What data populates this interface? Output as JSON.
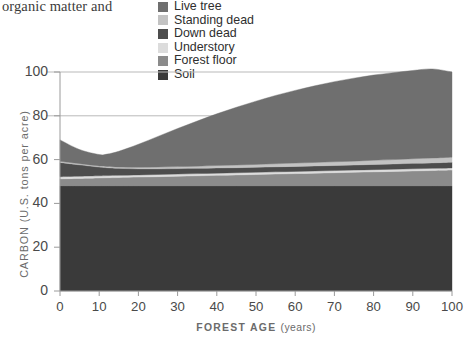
{
  "page": {
    "cut_off_text": "organic matter and"
  },
  "legend": {
    "position": "top-center",
    "items": [
      {
        "label": "Live tree",
        "color": "#6f6f6f",
        "key": "live_tree"
      },
      {
        "label": "Standing dead",
        "color": "#c3c3c3",
        "key": "standing_dead"
      },
      {
        "label": "Down dead",
        "color": "#4d4d4d",
        "key": "down_dead"
      },
      {
        "label": "Understory",
        "color": "#dcdcdc",
        "key": "understory"
      },
      {
        "label": "Forest floor",
        "color": "#8b8b8b",
        "key": "forest_floor"
      },
      {
        "label": "Soil",
        "color": "#3a3a3a",
        "key": "soil"
      }
    ]
  },
  "axes": {
    "x_label_main": "FOREST AGE",
    "x_label_unit": "(years)",
    "y_label": "CARBON (U.S. tons per acre)",
    "x_ticks": [
      "0",
      "10",
      "20",
      "30",
      "40",
      "50",
      "60",
      "70",
      "80",
      "90",
      "100"
    ],
    "y_ticks": [
      "0",
      "20",
      "40",
      "60",
      "80",
      "100"
    ]
  },
  "chart_data": {
    "type": "area",
    "stacked": true,
    "title": "",
    "xlabel": "FOREST AGE (years)",
    "ylabel": "CARBON (U.S. tons per acre)",
    "xlim": [
      0,
      100
    ],
    "ylim": [
      0,
      100
    ],
    "xticks": [
      0,
      10,
      20,
      30,
      40,
      50,
      60,
      70,
      80,
      90,
      100
    ],
    "yticks": [
      0,
      20,
      40,
      60,
      80,
      100
    ],
    "grid": "horizontal-light",
    "legend_position": "top-center",
    "x": [
      0,
      5,
      10,
      12,
      15,
      20,
      25,
      30,
      35,
      40,
      45,
      50,
      55,
      60,
      65,
      70,
      75,
      80,
      85,
      90,
      95,
      100
    ],
    "series": [
      {
        "name": "Soil",
        "color": "#3a3a3a",
        "values": [
          48,
          48,
          48,
          48,
          48,
          48,
          48,
          48,
          48,
          48,
          48,
          48,
          48,
          48,
          48,
          48,
          48,
          48,
          48,
          48,
          48,
          48
        ]
      },
      {
        "name": "Forest floor",
        "color": "#8b8b8b",
        "values": [
          3.2,
          3.4,
          3.6,
          3.7,
          3.8,
          4.0,
          4.2,
          4.4,
          4.6,
          4.8,
          5.0,
          5.2,
          5.4,
          5.6,
          5.8,
          6.0,
          6.2,
          6.4,
          6.6,
          6.8,
          7.0,
          7.2
        ]
      },
      {
        "name": "Understory",
        "color": "#dcdcdc",
        "values": [
          1.0,
          1.0,
          1.0,
          1.0,
          1.0,
          1.0,
          1.0,
          1.0,
          1.0,
          1.0,
          1.0,
          1.0,
          1.0,
          1.0,
          1.0,
          1.0,
          1.0,
          1.0,
          1.0,
          1.0,
          1.0,
          1.0
        ]
      },
      {
        "name": "Down dead",
        "color": "#4d4d4d",
        "values": [
          6.5,
          5.2,
          4.0,
          3.6,
          3.2,
          2.8,
          2.6,
          2.5,
          2.4,
          2.4,
          2.3,
          2.3,
          2.3,
          2.3,
          2.3,
          2.3,
          2.3,
          2.4,
          2.4,
          2.5,
          2.5,
          2.6
        ]
      },
      {
        "name": "Standing dead",
        "color": "#c3c3c3",
        "values": [
          0.5,
          0.5,
          0.5,
          0.6,
          0.6,
          0.7,
          0.8,
          0.9,
          1.0,
          1.1,
          1.2,
          1.3,
          1.4,
          1.5,
          1.6,
          1.7,
          1.8,
          1.9,
          2.0,
          2.1,
          2.2,
          2.3
        ]
      },
      {
        "name": "Live tree",
        "color": "#6f6f6f",
        "values": [
          9.8,
          6.5,
          5.2,
          5.6,
          7.2,
          10.5,
          14.0,
          17.4,
          20.6,
          23.6,
          26.4,
          28.9,
          31.2,
          33.2,
          35.0,
          36.6,
          37.9,
          38.9,
          39.7,
          40.3,
          40.7,
          38.9
        ]
      }
    ],
    "totals": [
      69.0,
      64.6,
      62.3,
      62.5,
      63.8,
      67.0,
      70.6,
      74.2,
      77.6,
      80.9,
      83.9,
      86.7,
      89.3,
      91.6,
      93.7,
      95.6,
      97.2,
      98.6,
      99.7,
      100.7,
      101.4,
      100.0
    ]
  }
}
